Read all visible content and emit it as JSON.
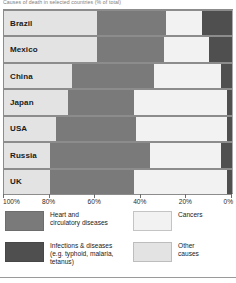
{
  "title": "Causes of death in selected countries (% of total)",
  "axis": {
    "ticks": [
      "100%",
      "80%",
      "60%",
      "40%",
      "20%",
      "0%"
    ],
    "reversed": true
  },
  "legend": {
    "items": [
      {
        "key": "heart",
        "label": "Heart and\ncirculatory diseases",
        "color": "#7a7a7a"
      },
      {
        "key": "cancer",
        "label": "Cancers",
        "color": "#f2f2f2"
      },
      {
        "key": "infect",
        "label": "Infections & diseases\n(e.g. typhoid, malaria,\ntetanus)",
        "color": "#4f4f4f"
      },
      {
        "key": "other",
        "label": "Other\ncauses",
        "color": "#e3e3e3"
      }
    ]
  },
  "chart_data": {
    "type": "bar",
    "subtype": "stacked-horizontal",
    "title": "Causes of death in selected countries (% of total)",
    "xlabel": "",
    "ylabel": "",
    "xlim": [
      0,
      100
    ],
    "x_axis_reversed": true,
    "xticks": [
      100,
      80,
      60,
      40,
      20,
      0
    ],
    "grid": true,
    "legend_position": "bottom",
    "categories": [
      "Brazil",
      "Mexico",
      "China",
      "Japan",
      "USA",
      "Russia",
      "UK"
    ],
    "series": [
      {
        "name": "Other causes",
        "color": "#e3e3e3",
        "values": [
          41,
          41,
          30,
          28,
          23,
          20,
          20
        ]
      },
      {
        "name": "Heart and circulatory diseases",
        "color": "#7a7a7a",
        "values": [
          30,
          29,
          36,
          29,
          35,
          44,
          37
        ]
      },
      {
        "name": "Cancers",
        "color": "#f2f2f2",
        "values": [
          16,
          20,
          29,
          41,
          40,
          31,
          41
        ]
      },
      {
        "name": "Infections & diseases (e.g. typhoid, malaria, tetanus)",
        "color": "#4f4f4f",
        "values": [
          13,
          10,
          5,
          2,
          2,
          5,
          2
        ]
      }
    ],
    "rows": [
      {
        "label": "Brazil",
        "other": 41,
        "heart": 30,
        "cancer": 16,
        "infect": 13
      },
      {
        "label": "Mexico",
        "other": 41,
        "heart": 29,
        "cancer": 20,
        "infect": 10
      },
      {
        "label": "China",
        "other": 30,
        "heart": 36,
        "cancer": 29,
        "infect": 5
      },
      {
        "label": "Japan",
        "other": 28,
        "heart": 29,
        "cancer": 41,
        "infect": 2
      },
      {
        "label": "USA",
        "other": 23,
        "heart": 35,
        "cancer": 40,
        "infect": 2
      },
      {
        "label": "Russia",
        "other": 20,
        "heart": 44,
        "cancer": 31,
        "infect": 5
      },
      {
        "label": "UK",
        "other": 20,
        "heart": 37,
        "cancer": 41,
        "infect": 2
      }
    ]
  }
}
